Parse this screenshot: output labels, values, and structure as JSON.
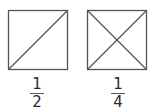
{
  "diagram": {
    "stroke_color": "#555555",
    "background": "#ffffff",
    "squares": [
      {
        "id": "half",
        "divisions": "one diagonal",
        "parts": 2,
        "label": {
          "numerator": "1",
          "denominator": "2"
        }
      },
      {
        "id": "quarter",
        "divisions": "two diagonals",
        "parts": 4,
        "label": {
          "numerator": "1",
          "denominator": "4"
        }
      }
    ]
  }
}
